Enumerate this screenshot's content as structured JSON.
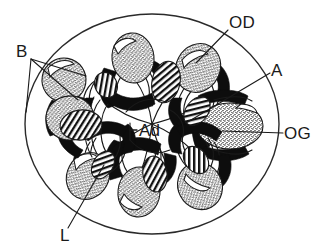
{
  "figure": {
    "kind": "anatomical-cross-section",
    "background_color": "#ffffff",
    "ink_color": "#1a1a1a",
    "fill_black": "#0d0d0d"
  },
  "outer_boundary": {
    "name": "body-wall-outline",
    "shape": "ellipse",
    "cx": 152,
    "cy": 124,
    "rx": 127,
    "ry": 110
  },
  "labels": [
    {
      "id": "B",
      "text": "B",
      "x": 16,
      "y": 57,
      "anchor": "start"
    },
    {
      "id": "OD",
      "text": "OD",
      "x": 229,
      "y": 28,
      "anchor": "start"
    },
    {
      "id": "A",
      "text": "A",
      "x": 271,
      "y": 76,
      "anchor": "start"
    },
    {
      "id": "OG",
      "text": "OG",
      "x": 284,
      "y": 139,
      "anchor": "start"
    },
    {
      "id": "Ad",
      "text": "Ad",
      "x": 139,
      "y": 136,
      "anchor": "start"
    },
    {
      "id": "L",
      "text": "L",
      "x": 60,
      "y": 241,
      "anchor": "start"
    }
  ],
  "leader_lines": [
    {
      "for": "B",
      "path": "M 31 59 L 86 76"
    },
    {
      "for": "B",
      "path": "M 31 59 L 78 100"
    },
    {
      "for": "B",
      "path": "M 31 59 L 26 110"
    },
    {
      "for": "OD",
      "path": "M 228 30 L 196 63"
    },
    {
      "for": "A",
      "path": "M 270 73 L 186 123"
    },
    {
      "for": "OG",
      "path": "M 283 133 L 222 131"
    },
    {
      "for": "Ad",
      "path": "M 137 130 L 131 130 L 131 124"
    },
    {
      "for": "Ad",
      "path": "M 137 137 L 131 137 L 131 143"
    },
    {
      "for": "L",
      "path": "M 68 228 L 104 165"
    }
  ],
  "radial_units": {
    "count": 8,
    "component_names": {
      "stipple": "stippled-gonad-lobe",
      "chevron": "black-muscular-chevron",
      "hatched": "hatched-lamella",
      "canal": "radial-canal-line"
    },
    "angles_deg": [
      0,
      45,
      90,
      135,
      180,
      225,
      270,
      315
    ]
  },
  "legend_keys": {
    "B": "Bursa",
    "OD": "Oviduct",
    "A": "Ampulla",
    "OG": "Genital organ",
    "Ad": "Adductor",
    "L": "Lumen"
  }
}
